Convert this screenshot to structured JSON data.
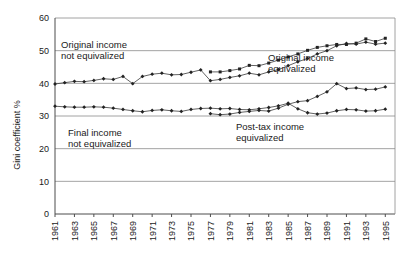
{
  "chart_data": {
    "type": "line",
    "title": "",
    "xlabel": "",
    "ylabel": "Gini coefficient %",
    "ylim": [
      0,
      60
    ],
    "ytick_values": [
      0,
      10,
      20,
      30,
      40,
      50,
      60
    ],
    "ytick_labels": [
      "0",
      "10",
      "20",
      "30",
      "40",
      "50",
      "60"
    ],
    "xlim": [
      1961,
      1996
    ],
    "xtick_values": [
      1961,
      1963,
      1965,
      1967,
      1969,
      1971,
      1973,
      1975,
      1977,
      1979,
      1981,
      1983,
      1985,
      1987,
      1989,
      1991,
      1993,
      1995
    ],
    "xtick_labels": [
      "1961",
      "1963",
      "1965",
      "1967",
      "1969",
      "1971",
      "1973",
      "1975",
      "1977",
      "1979",
      "1981",
      "1983",
      "1985",
      "1987",
      "1989",
      "1991",
      "1993",
      "1995"
    ],
    "grid": true,
    "grid_axis": "y",
    "legend_position": "inline-annotations",
    "x": [
      1961,
      1962,
      1963,
      1964,
      1965,
      1966,
      1967,
      1968,
      1969,
      1970,
      1971,
      1972,
      1973,
      1974,
      1975,
      1976,
      1977,
      1978,
      1979,
      1980,
      1981,
      1982,
      1983,
      1984,
      1985,
      1986,
      1987,
      1988,
      1989,
      1990,
      1991,
      1992,
      1993,
      1994,
      1995
    ],
    "series": [
      {
        "name": "Original income not equivalized",
        "marker": "diamond",
        "x": [
          1961,
          1962,
          1963,
          1964,
          1965,
          1966,
          1967,
          1968,
          1969,
          1970,
          1971,
          1972,
          1973,
          1974,
          1975,
          1976,
          1977,
          1978,
          1979,
          1980,
          1981,
          1982,
          1983,
          1984,
          1985,
          1986,
          1987,
          1988,
          1989,
          1990,
          1991,
          1992,
          1993,
          1994,
          1995
        ],
        "values": [
          39.8,
          40.2,
          40.6,
          40.5,
          40.9,
          41.4,
          41.2,
          42.1,
          39.9,
          42.1,
          42.8,
          43.1,
          42.6,
          42.7,
          43.4,
          44.1,
          40.8,
          41.2,
          41.8,
          42.3,
          43.1,
          42.6,
          43.5,
          44.2,
          45.4,
          46.6,
          47.6,
          49.0,
          50.0,
          51.5,
          52.2,
          52.0,
          52.6,
          52.0,
          52.3
        ]
      },
      {
        "name": "Original income equivalized",
        "marker": "square",
        "x": [
          1977,
          1978,
          1979,
          1980,
          1981,
          1982,
          1983,
          1984,
          1985,
          1986,
          1987,
          1988,
          1989,
          1990,
          1991,
          1992,
          1993,
          1994,
          1995
        ],
        "values": [
          43.5,
          43.5,
          43.9,
          44.4,
          45.5,
          45.4,
          46.2,
          47.1,
          48.1,
          49.0,
          50.1,
          51.0,
          51.5,
          51.9,
          51.9,
          52.3,
          53.6,
          52.8,
          53.8
        ]
      },
      {
        "name": "Final income not equivalized",
        "marker": "diamond",
        "x": [
          1961,
          1962,
          1963,
          1964,
          1965,
          1966,
          1967,
          1968,
          1969,
          1970,
          1971,
          1972,
          1973,
          1974,
          1975,
          1976,
          1977,
          1978,
          1979,
          1980,
          1981,
          1982,
          1983,
          1984,
          1985,
          1986,
          1987,
          1988,
          1989,
          1990,
          1991,
          1992,
          1993,
          1994,
          1995
        ],
        "values": [
          33.0,
          32.8,
          32.7,
          32.7,
          32.8,
          32.7,
          32.4,
          32.0,
          31.6,
          31.3,
          31.7,
          31.9,
          31.6,
          31.4,
          32.0,
          32.3,
          32.4,
          32.2,
          32.3,
          32.0,
          31.9,
          32.2,
          32.6,
          33.1,
          33.9,
          32.2,
          31.0,
          30.6,
          30.9,
          31.6,
          32.0,
          31.9,
          31.5,
          31.6,
          32.1
        ]
      },
      {
        "name": "Post-tax income equivalized",
        "marker": "diamond",
        "x": [
          1977,
          1978,
          1979,
          1980,
          1981,
          1982,
          1983,
          1984,
          1985,
          1986,
          1987,
          1988,
          1989,
          1990,
          1991,
          1992,
          1993,
          1994,
          1995
        ],
        "values": [
          30.7,
          30.4,
          30.6,
          31.1,
          31.4,
          31.7,
          31.5,
          32.4,
          33.6,
          34.4,
          34.7,
          36.0,
          37.4,
          39.9,
          38.4,
          38.6,
          38.1,
          38.2,
          38.9
        ]
      }
    ],
    "annotations": [
      {
        "id": "original-income-not-equivalized",
        "line1": "Original income",
        "line2": "not equivalized",
        "x": 61,
        "y": 48
      },
      {
        "id": "original-income-equivalized",
        "line1": "Original income",
        "line2": "equivalized",
        "x": 268,
        "y": 61
      },
      {
        "id": "final-income-not-equivalized",
        "line1": "Final income",
        "line2": "not equivalized",
        "x": 68,
        "y": 136
      },
      {
        "id": "post-tax-income-equivalized",
        "line1": "Post-tax income",
        "line2": "equivalized",
        "x": 236,
        "y": 130
      }
    ]
  },
  "colors": {
    "line": "#3a3a3a",
    "marker": "#222222",
    "grid": "#8c8c8c",
    "axis": "#4d4d4d",
    "text": "#1a1a1a",
    "background": "#ffffff"
  }
}
